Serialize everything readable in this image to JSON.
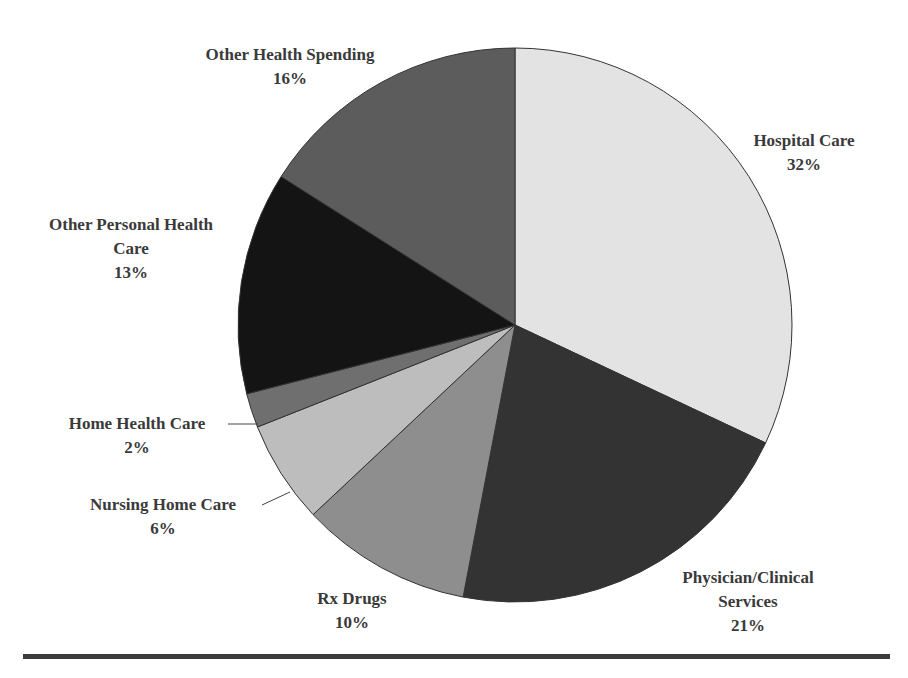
{
  "chart_data": {
    "type": "pie",
    "title": "",
    "start_angle_deg": 0,
    "direction": "clockwise",
    "slices": [
      {
        "label": "Hospital Care",
        "value": 32,
        "pct_label": "32%",
        "color": "#e3e3e3"
      },
      {
        "label": "Physician/Clinical Services",
        "value": 21,
        "pct_label": "21%",
        "color": "#333333"
      },
      {
        "label": "Rx Drugs",
        "value": 10,
        "pct_label": "10%",
        "color": "#8e8e8e"
      },
      {
        "label": "Nursing Home Care",
        "value": 6,
        "pct_label": "6%",
        "color": "#bdbdbd"
      },
      {
        "label": "Home Health Care",
        "value": 2,
        "pct_label": "2%",
        "color": "#6f6f6f"
      },
      {
        "label": "Other Personal Health Care",
        "value": 13,
        "pct_label": "13%",
        "color": "#141414"
      },
      {
        "label": "Other Health Spending",
        "value": 16,
        "pct_label": "16%",
        "color": "#5c5c5c"
      }
    ]
  },
  "labels": {
    "hospital": {
      "line1": "Hospital Care",
      "pct": "32%"
    },
    "physician": {
      "line1": "Physician/Clinical",
      "line2": "Services",
      "pct": "21%"
    },
    "rx": {
      "line1": "Rx Drugs",
      "pct": "10%"
    },
    "nursing": {
      "line1": "Nursing Home Care",
      "pct": "6%"
    },
    "home_health": {
      "line1": "Home Health Care",
      "pct": "2%"
    },
    "other_personal": {
      "line1": "Other Personal Health",
      "line2": "Care",
      "pct": "13%"
    },
    "other_spending": {
      "line1": "Other Health Spending",
      "pct": "16%"
    }
  }
}
